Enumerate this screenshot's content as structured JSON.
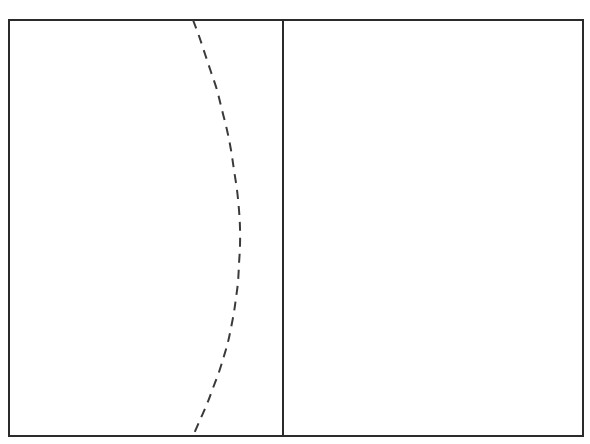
{
  "figure": {
    "width": 590,
    "height": 444,
    "background_color": "#ffffff",
    "title": "",
    "caption": ""
  },
  "chart_data": {
    "type": "line",
    "title": "",
    "subtitle": "",
    "xlabel": "",
    "ylabel": "",
    "xlim": [
      0,
      100
    ],
    "ylim": [
      0,
      100
    ],
    "grid": false,
    "legend_position": "none",
    "legend_entries": [],
    "xticks": [],
    "yticks": [],
    "xtick_labels": [],
    "ytick_labels": [],
    "annotations": [],
    "axes_frame": {
      "name": "plot-border",
      "x": 9,
      "y": 20,
      "width": 574,
      "height": 416,
      "stroke_color": "#2b2b2b",
      "stroke_width": 1.4,
      "fill_color": "#ffffff"
    },
    "series": [
      {
        "name": "vertical-reference-line",
        "type": "vline",
        "style": "solid",
        "stroke_color": "#2b2b2b",
        "stroke_width": 1.4,
        "x_pixel": 283,
        "x_value": 47.7,
        "y_pixel_start": 20,
        "y_pixel_end": 436,
        "label": ""
      },
      {
        "name": "dashed-curve",
        "type": "line",
        "style": "dashed",
        "dash_pattern": "9 7",
        "stroke_color": "#3a3a3a",
        "stroke_width": 2.0,
        "label": "",
        "points_pixel": [
          [
            193,
            20
          ],
          [
            199,
            36
          ],
          [
            205,
            54
          ],
          [
            211,
            72
          ],
          [
            217,
            90
          ],
          [
            222,
            110
          ],
          [
            227,
            130
          ],
          [
            231,
            150
          ],
          [
            234,
            170
          ],
          [
            237,
            190
          ],
          [
            239,
            210
          ],
          [
            240,
            228
          ],
          [
            240,
            246
          ],
          [
            239,
            264
          ],
          [
            238,
            282
          ],
          [
            236,
            298
          ],
          [
            234,
            312
          ],
          [
            231,
            328
          ],
          [
            228,
            342
          ],
          [
            224,
            356
          ],
          [
            219,
            372
          ],
          [
            213,
            388
          ],
          [
            207,
            404
          ],
          [
            200,
            420
          ],
          [
            193,
            436
          ]
        ],
        "points_data": [
          [
            32.1,
            100.0
          ],
          [
            33.1,
            96.2
          ],
          [
            34.1,
            91.8
          ],
          [
            35.2,
            87.5
          ],
          [
            36.2,
            83.2
          ],
          [
            37.1,
            78.4
          ],
          [
            38.0,
            73.6
          ],
          [
            38.7,
            68.8
          ],
          [
            39.2,
            63.9
          ],
          [
            39.7,
            59.1
          ],
          [
            40.1,
            54.3
          ],
          [
            40.2,
            50.0
          ],
          [
            40.2,
            45.7
          ],
          [
            40.1,
            41.3
          ],
          [
            39.9,
            37.0
          ],
          [
            39.5,
            33.2
          ],
          [
            39.2,
            29.8
          ],
          [
            38.7,
            26.0
          ],
          [
            38.1,
            22.6
          ],
          [
            37.5,
            19.2
          ],
          [
            36.6,
            15.4
          ],
          [
            35.5,
            11.5
          ],
          [
            34.5,
            7.7
          ],
          [
            33.3,
            3.8
          ],
          [
            32.1,
            0.0
          ]
        ]
      }
    ]
  }
}
